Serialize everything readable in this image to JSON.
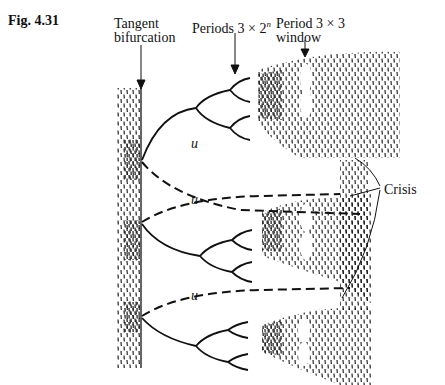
{
  "figure": {
    "label": "Fig. 4.31"
  },
  "annotations": {
    "tangent_line1": "Tangent",
    "tangent_line2": "bifurcation",
    "periods_label": "Periods 3 × 2",
    "periods_superscript": "n",
    "window_line1": "Period 3 × 3",
    "window_line2": "window",
    "crisis": "Crisis",
    "unstable_1": "u",
    "unstable_2": "u",
    "unstable_3": "u"
  },
  "colors": {
    "ink": "#111111",
    "background": "#ffffff"
  }
}
